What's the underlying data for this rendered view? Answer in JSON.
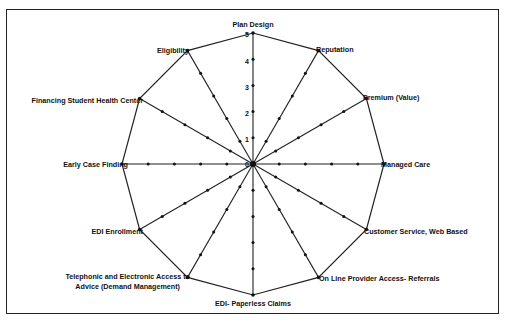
{
  "chart_data": {
    "type": "radar",
    "title": "",
    "axes": [
      "Plan Design",
      "Reputation",
      "Premium (Value)",
      "Managed Care",
      "Customer Service, Web Based",
      "On Line Provider Access- Referrals",
      "EDI- Paperless Claims",
      "Telephonic and Electronic Access to Advice (Demand Management)",
      "EDI Enrollment",
      "Early Case Finding",
      "Financing Student Health Center",
      "Eligibility"
    ],
    "series": [
      {
        "name": "Score",
        "values": [
          5,
          5,
          5,
          5,
          5,
          5,
          5,
          5,
          5,
          5,
          5,
          5
        ]
      }
    ],
    "radial_ticks": [
      0,
      1,
      2,
      3,
      4,
      5
    ],
    "rlim": [
      0,
      5
    ],
    "grid": false,
    "legend": "none"
  },
  "labels": {
    "plan_design": "Plan Design",
    "reputation": "Reputation",
    "premium": "Premium (Value)",
    "managed_care": "Managed Care",
    "customer_service": "Customer Service, Web Based",
    "online_provider": "On Line Provider Access- Referrals",
    "edi_paperless": "EDI- Paperless Claims",
    "telephonic_line1": "Telephonic and Electronic Access to",
    "telephonic_line2": "Advice (Demand Management)",
    "edi_enrollment": "EDI Enrollment",
    "early_case": "Early Case Finding",
    "financing": "Financing Student Health Center",
    "eligibility": "Eligibility"
  },
  "ticks": {
    "t0": "0",
    "t1": "1",
    "t2": "2",
    "t3": "3",
    "t4": "4",
    "t5": "5"
  }
}
